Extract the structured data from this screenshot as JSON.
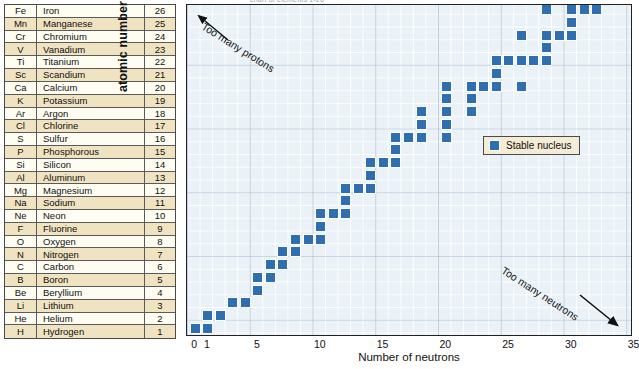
{
  "title_faint": "chart of elements 1-26",
  "table": {
    "header_rotated_label": "atomic number",
    "columns": [
      "symbol",
      "name",
      "number"
    ],
    "rows": [
      {
        "symbol": "Fe",
        "name": "Iron",
        "number": 26,
        "shade": "cream"
      },
      {
        "symbol": "Mn",
        "name": "Manganese",
        "number": 25,
        "shade": "tan"
      },
      {
        "symbol": "Cr",
        "name": "Chromium",
        "number": 24,
        "shade": "cream"
      },
      {
        "symbol": "V",
        "name": "Vanadium",
        "number": 23,
        "shade": "tan"
      },
      {
        "symbol": "Ti",
        "name": "Titanium",
        "number": 22,
        "shade": "cream"
      },
      {
        "symbol": "Sc",
        "name": "Scandium",
        "number": 21,
        "shade": "tan"
      },
      {
        "symbol": "Ca",
        "name": "Calcium",
        "number": 20,
        "shade": "cream"
      },
      {
        "symbol": "K",
        "name": "Potassium",
        "number": 19,
        "shade": "tan"
      },
      {
        "symbol": "Ar",
        "name": "Argon",
        "number": 18,
        "shade": "cream"
      },
      {
        "symbol": "Cl",
        "name": "Chlorine",
        "number": 17,
        "shade": "tan"
      },
      {
        "symbol": "S",
        "name": "Sulfur",
        "number": 16,
        "shade": "cream"
      },
      {
        "symbol": "P",
        "name": "Phosphorous",
        "number": 15,
        "shade": "tan"
      },
      {
        "symbol": "Si",
        "name": "Silicon",
        "number": 14,
        "shade": "cream"
      },
      {
        "symbol": "Al",
        "name": "Aluminum",
        "number": 13,
        "shade": "tan"
      },
      {
        "symbol": "Mg",
        "name": "Magnesium",
        "number": 12,
        "shade": "cream"
      },
      {
        "symbol": "Na",
        "name": "Sodium",
        "number": 11,
        "shade": "tan"
      },
      {
        "symbol": "Ne",
        "name": "Neon",
        "number": 10,
        "shade": "cream"
      },
      {
        "symbol": "F",
        "name": "Fluorine",
        "number": 9,
        "shade": "tan"
      },
      {
        "symbol": "O",
        "name": "Oxygen",
        "number": 8,
        "shade": "cream"
      },
      {
        "symbol": "N",
        "name": "Nitrogen",
        "number": 7,
        "shade": "tan"
      },
      {
        "symbol": "C",
        "name": "Carbon",
        "number": 6,
        "shade": "cream"
      },
      {
        "symbol": "B",
        "name": "Boron",
        "number": 5,
        "shade": "tan"
      },
      {
        "symbol": "Be",
        "name": "Beryllium",
        "number": 4,
        "shade": "cream"
      },
      {
        "symbol": "Li",
        "name": "Lithium",
        "number": 3,
        "shade": "tan"
      },
      {
        "symbol": "He",
        "name": "Helium",
        "number": 2,
        "shade": "cream"
      },
      {
        "symbol": "H",
        "name": "Hydrogen",
        "number": 1,
        "shade": "tan"
      }
    ]
  },
  "legend": {
    "label": "Stable nucleus",
    "color": "#2f6fb0"
  },
  "annotations": [
    {
      "id": "too-many-protons",
      "text": "Too many protons"
    },
    {
      "id": "too-many-neutrons",
      "text": "Too many neutrons"
    }
  ],
  "chart_data": {
    "type": "scatter",
    "title": "",
    "xlabel": "Number of neutrons",
    "ylabel": "atomic number",
    "xlim": [
      0,
      35.5
    ],
    "ylim": [
      0,
      26.5
    ],
    "xticks": [
      0,
      1,
      5,
      10,
      15,
      20,
      25,
      30,
      35
    ],
    "xtick_labels": [
      "0",
      "1",
      "5",
      "10",
      "15",
      "20",
      "25",
      "30",
      "35"
    ],
    "yticks": [
      1,
      2,
      3,
      4,
      5,
      6,
      7,
      8,
      9,
      10,
      11,
      12,
      13,
      14,
      15,
      16,
      17,
      18,
      19,
      20,
      21,
      22,
      23,
      24,
      25,
      26
    ],
    "grid": true,
    "legend_position": "right-middle",
    "series": [
      {
        "name": "Stable nucleus",
        "color": "#2f6fb0",
        "marker": "square",
        "points": [
          {
            "n": 0,
            "z": 1
          },
          {
            "n": 1,
            "z": 1
          },
          {
            "n": 1,
            "z": 2
          },
          {
            "n": 2,
            "z": 2
          },
          {
            "n": 3,
            "z": 3
          },
          {
            "n": 4,
            "z": 3
          },
          {
            "n": 5,
            "z": 4
          },
          {
            "n": 5,
            "z": 5
          },
          {
            "n": 6,
            "z": 5
          },
          {
            "n": 6,
            "z": 6
          },
          {
            "n": 7,
            "z": 6
          },
          {
            "n": 7,
            "z": 7
          },
          {
            "n": 8,
            "z": 7
          },
          {
            "n": 8,
            "z": 8
          },
          {
            "n": 9,
            "z": 8
          },
          {
            "n": 10,
            "z": 8
          },
          {
            "n": 10,
            "z": 9
          },
          {
            "n": 10,
            "z": 10
          },
          {
            "n": 11,
            "z": 10
          },
          {
            "n": 12,
            "z": 10
          },
          {
            "n": 12,
            "z": 11
          },
          {
            "n": 12,
            "z": 12
          },
          {
            "n": 13,
            "z": 12
          },
          {
            "n": 14,
            "z": 12
          },
          {
            "n": 14,
            "z": 13
          },
          {
            "n": 14,
            "z": 14
          },
          {
            "n": 15,
            "z": 14
          },
          {
            "n": 16,
            "z": 14
          },
          {
            "n": 16,
            "z": 15
          },
          {
            "n": 16,
            "z": 16
          },
          {
            "n": 17,
            "z": 16
          },
          {
            "n": 18,
            "z": 16
          },
          {
            "n": 20,
            "z": 16
          },
          {
            "n": 18,
            "z": 17
          },
          {
            "n": 20,
            "z": 17
          },
          {
            "n": 18,
            "z": 18
          },
          {
            "n": 20,
            "z": 18
          },
          {
            "n": 22,
            "z": 18
          },
          {
            "n": 20,
            "z": 19
          },
          {
            "n": 22,
            "z": 19
          },
          {
            "n": 20,
            "z": 20
          },
          {
            "n": 22,
            "z": 20
          },
          {
            "n": 23,
            "z": 20
          },
          {
            "n": 24,
            "z": 20
          },
          {
            "n": 26,
            "z": 20
          },
          {
            "n": 24,
            "z": 21
          },
          {
            "n": 24,
            "z": 22
          },
          {
            "n": 25,
            "z": 22
          },
          {
            "n": 26,
            "z": 22
          },
          {
            "n": 27,
            "z": 22
          },
          {
            "n": 28,
            "z": 22
          },
          {
            "n": 28,
            "z": 23
          },
          {
            "n": 26,
            "z": 24
          },
          {
            "n": 28,
            "z": 24
          },
          {
            "n": 29,
            "z": 24
          },
          {
            "n": 30,
            "z": 24
          },
          {
            "n": 30,
            "z": 25
          },
          {
            "n": 28,
            "z": 26
          },
          {
            "n": 30,
            "z": 26
          },
          {
            "n": 31,
            "z": 26
          },
          {
            "n": 32,
            "z": 26
          }
        ]
      }
    ]
  }
}
